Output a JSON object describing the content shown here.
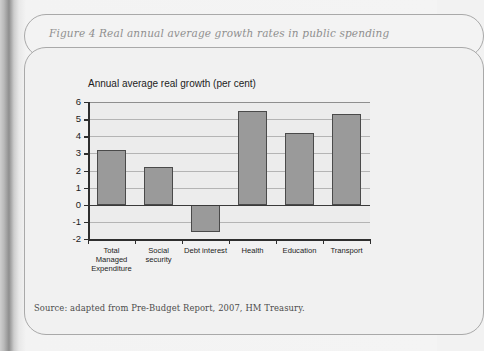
{
  "figure": {
    "caption": "Figure 4 Real annual average growth rates in public spending",
    "source": "Source: adapted from Pre-Budget Report, 2007, HM Treasury."
  },
  "colors": {
    "bar_fill": "#9a9a9a",
    "bar_stroke": "#4a4a4a",
    "plot_background": "#ececec",
    "gridline": "#b4b4b4",
    "axis": "#2e2e2e",
    "caption_text": "#8f8f8f",
    "box_border": "#a9a9a9"
  },
  "chart_data": {
    "type": "bar",
    "title": "Annual average real growth (per cent)",
    "xlabel": "",
    "ylabel": "",
    "categories": [
      "Total Managed Expenditure",
      "Social security",
      "Debt interest",
      "Health",
      "Education",
      "Transport"
    ],
    "values": [
      3.2,
      2.2,
      -1.6,
      5.5,
      4.2,
      5.3
    ],
    "ylim": [
      -2,
      6
    ],
    "ytick_labels": [
      "6",
      "5",
      "4",
      "3",
      "2",
      "1",
      "0",
      "-1",
      "-2"
    ],
    "yticks": [
      6,
      5,
      4,
      3,
      2,
      1,
      0,
      -1,
      -2
    ],
    "grid": true,
    "legend": false
  }
}
